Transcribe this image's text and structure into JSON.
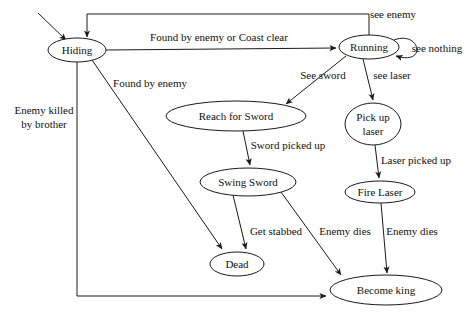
{
  "diagram": {
    "type": "state-transition-diagram",
    "canvas": {
      "width": 474,
      "height": 318,
      "background": "#ffffff"
    },
    "stroke_color": "#1a1a1a",
    "text_color": "#111111",
    "states": [
      {
        "id": "hiding",
        "label": "Hiding",
        "cx": 77,
        "cy": 50,
        "rx": 29,
        "ry": 12
      },
      {
        "id": "running",
        "label": "Running",
        "cx": 369,
        "cy": 47,
        "rx": 30,
        "ry": 12
      },
      {
        "id": "reach_sword",
        "label": "Reach for Sword",
        "cx": 236,
        "cy": 116,
        "rx": 70,
        "ry": 15
      },
      {
        "id": "pickup_laser",
        "label_line1": "Pick up",
        "label_line2": "laser",
        "cx": 373,
        "cy": 124,
        "rx": 28,
        "ry": 21
      },
      {
        "id": "swing_sword",
        "label": "Swing Sword",
        "cx": 248,
        "cy": 182,
        "rx": 48,
        "ry": 14
      },
      {
        "id": "fire_laser",
        "label": "Fire Laser",
        "cx": 380,
        "cy": 192,
        "rx": 35,
        "ry": 11
      },
      {
        "id": "dead",
        "label": "Dead",
        "cx": 237,
        "cy": 264,
        "rx": 27,
        "ry": 12
      },
      {
        "id": "become_king",
        "label": "Become king",
        "cx": 386,
        "cy": 290,
        "rx": 56,
        "ry": 15
      }
    ],
    "transitions": [
      {
        "id": "start",
        "from": "",
        "to": "hiding",
        "label": ""
      },
      {
        "id": "running_to_hiding",
        "from": "running",
        "to": "hiding",
        "label": "see enemy",
        "lx": 393,
        "ly": 15
      },
      {
        "id": "hiding_to_running",
        "from": "hiding",
        "to": "running",
        "label": "Found by enemy or Coast clear",
        "lx": 219,
        "ly": 38
      },
      {
        "id": "running_self",
        "from": "running",
        "to": "running",
        "label": "see nothing",
        "lx": 437,
        "ly": 49
      },
      {
        "id": "hiding_to_dead",
        "from": "hiding",
        "to": "dead",
        "label": "Found by enemy",
        "lx": 150,
        "ly": 84
      },
      {
        "id": "running_to_reach",
        "from": "running",
        "to": "reach_sword",
        "label": "See sword",
        "lx": 323,
        "ly": 76
      },
      {
        "id": "running_to_pickup",
        "from": "running",
        "to": "pickup_laser",
        "label": "see laser",
        "lx": 392,
        "ly": 76
      },
      {
        "id": "hiding_to_king",
        "from": "hiding",
        "to": "become_king",
        "label_line1": "Enemy killed",
        "label_line2": "by brother",
        "lx": 44,
        "ly": 111
      },
      {
        "id": "reach_to_swing",
        "from": "reach_sword",
        "to": "swing_sword",
        "label": "Sword picked up",
        "lx": 288,
        "ly": 146
      },
      {
        "id": "pickup_to_fire",
        "from": "pickup_laser",
        "to": "fire_laser",
        "label": "Laser picked up",
        "lx": 416,
        "ly": 161
      },
      {
        "id": "swing_to_dead",
        "from": "swing_sword",
        "to": "dead",
        "label": "Get stabbed",
        "lx": 276,
        "ly": 232
      },
      {
        "id": "swing_to_king",
        "from": "swing_sword",
        "to": "become_king",
        "label": "Enemy dies",
        "lx": 345,
        "ly": 232
      },
      {
        "id": "fire_to_king",
        "from": "fire_laser",
        "to": "become_king",
        "label": "Enemy dies",
        "lx": 412,
        "ly": 232
      }
    ]
  }
}
